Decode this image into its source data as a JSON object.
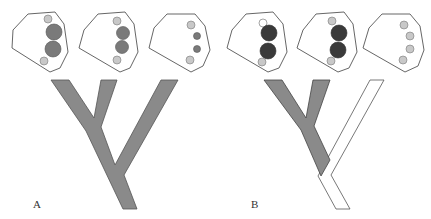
{
  "figure": {
    "panels": [
      {
        "label": "A",
        "tree_fill": "#8a8a8a",
        "blobs": [
          {
            "small_top": "#c8c8c8",
            "big": [
              "#7a7a7a",
              "#7a7a7a"
            ],
            "small_bottom": "#c8c8c8"
          },
          {
            "small_top": "#c8c8c8",
            "big": [
              "#7a7a7a",
              "#7a7a7a"
            ],
            "small_bottom": "#c8c8c8"
          },
          {
            "dots": [
              "#c8c8c8",
              "#7a7a7a",
              "#7a7a7a",
              "#c8c8c8"
            ]
          }
        ]
      },
      {
        "label": "B",
        "tree_fill": "#8a8a8a",
        "tree_white_fill": "#ffffff",
        "blobs": [
          {
            "small_top": "#ffffff",
            "big": [
              "#3a3a3a",
              "#3a3a3a"
            ],
            "small_bottom": "#c8c8c8"
          },
          {
            "small_top": "#c8c8c8",
            "big": [
              "#3a3a3a",
              "#3a3a3a"
            ],
            "small_bottom": "#c8c8c8"
          },
          {
            "dots": [
              "#c8c8c8",
              "#c8c8c8",
              "#c8c8c8",
              "#c8c8c8"
            ]
          }
        ]
      }
    ]
  }
}
